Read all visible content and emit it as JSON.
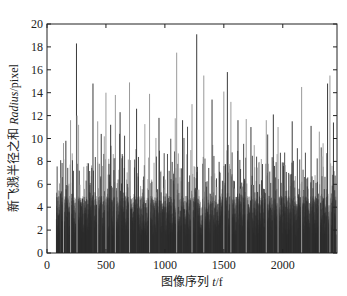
{
  "chart_data": {
    "type": "bar",
    "title": "",
    "xlabel": "图像序列 t/f",
    "xlabel_parts": {
      "cn": "图像序列 ",
      "var": "t",
      "unit": "/f"
    },
    "ylabel": "新飞溅半径之和 Radius/pixel",
    "ylabel_parts": {
      "cn": "新飞溅半径之和 ",
      "var": "Radius",
      "unit": "/pixel"
    },
    "xlim": [
      0,
      2460
    ],
    "ylim": [
      0,
      20
    ],
    "x_ticks": [
      0,
      500,
      1000,
      1500,
      2000
    ],
    "x_tick_labels": [
      "0",
      "500",
      "1000",
      "1500",
      "2000"
    ],
    "y_ticks": [
      0,
      2,
      4,
      6,
      8,
      10,
      12,
      14,
      16,
      18,
      20
    ],
    "y_tick_labels": [
      "0",
      "2",
      "4",
      "6",
      "8",
      "10",
      "12",
      "14",
      "16",
      "18",
      "20"
    ],
    "grid": false,
    "legend": null,
    "data_start_frame": 80,
    "data_end_frame": 2450,
    "typical_range": [
      0,
      9
    ],
    "notable_peaks": [
      {
        "x": 115,
        "y": 5.2
      },
      {
        "x": 140,
        "y": 9.6
      },
      {
        "x": 160,
        "y": 9.8
      },
      {
        "x": 200,
        "y": 11.6
      },
      {
        "x": 250,
        "y": 18.3
      },
      {
        "x": 255,
        "y": 12.0
      },
      {
        "x": 390,
        "y": 14.8
      },
      {
        "x": 430,
        "y": 11.5
      },
      {
        "x": 460,
        "y": 10.4
      },
      {
        "x": 500,
        "y": 14.0
      },
      {
        "x": 540,
        "y": 11.2
      },
      {
        "x": 580,
        "y": 13.8
      },
      {
        "x": 620,
        "y": 12.3
      },
      {
        "x": 700,
        "y": 14.9
      },
      {
        "x": 760,
        "y": 12.6
      },
      {
        "x": 870,
        "y": 13.9
      },
      {
        "x": 950,
        "y": 11.8
      },
      {
        "x": 1100,
        "y": 17.5
      },
      {
        "x": 1150,
        "y": 11.6
      },
      {
        "x": 1230,
        "y": 13.0
      },
      {
        "x": 1270,
        "y": 19.1
      },
      {
        "x": 1330,
        "y": 15.5
      },
      {
        "x": 1400,
        "y": 13.4
      },
      {
        "x": 1500,
        "y": 14.1
      },
      {
        "x": 1530,
        "y": 15.8
      },
      {
        "x": 1560,
        "y": 13.2
      },
      {
        "x": 1620,
        "y": 11.6
      },
      {
        "x": 1690,
        "y": 11.7
      },
      {
        "x": 1730,
        "y": 11.0
      },
      {
        "x": 1860,
        "y": 11.6
      },
      {
        "x": 1920,
        "y": 12.1
      },
      {
        "x": 1960,
        "y": 11.0
      },
      {
        "x": 2080,
        "y": 11.5
      },
      {
        "x": 2160,
        "y": 14.5
      },
      {
        "x": 2240,
        "y": 11.1
      },
      {
        "x": 2310,
        "y": 10.6
      },
      {
        "x": 2380,
        "y": 14.8
      },
      {
        "x": 2400,
        "y": 15.5
      },
      {
        "x": 2430,
        "y": 11.4
      }
    ],
    "colors": {
      "dark_bar": "#3a3a3a",
      "light_bar": "#9a9a9a",
      "axis": "#222222"
    }
  }
}
